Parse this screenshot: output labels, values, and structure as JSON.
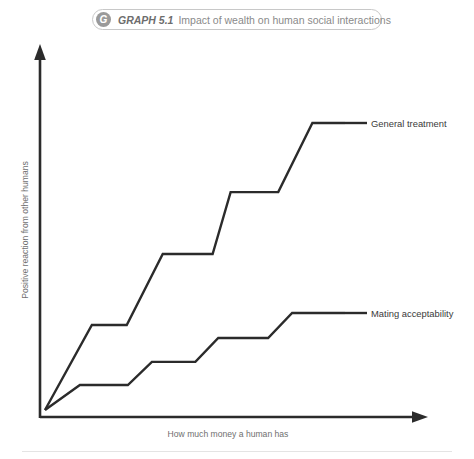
{
  "title": {
    "badge_letter": "G",
    "number_label": "GRAPH 5.1",
    "caption": "Impact of wealth on human social interactions"
  },
  "chart_data": {
    "type": "line",
    "title": "Impact of wealth on human social interactions",
    "xlabel": "How much money a human has",
    "ylabel": "Positive reaction from other humans",
    "grid": false,
    "legend_position": "right-inline",
    "axes_style": "arrow",
    "xlim": [
      0,
      10
    ],
    "ylim": [
      0,
      10
    ],
    "note": "Both series are rising staircase step functions starting from a common origin; axes are unlabeled/qualitative.",
    "series": [
      {
        "name": "General treatment",
        "label": "General treatment",
        "color": "#2b2b2b",
        "points": [
          {
            "x": 0.0,
            "y": 0.0
          },
          {
            "x": 1.25,
            "y": 2.35
          },
          {
            "x": 2.18,
            "y": 2.35
          },
          {
            "x": 3.14,
            "y": 4.31
          },
          {
            "x": 4.47,
            "y": 4.31
          },
          {
            "x": 4.95,
            "y": 6.02
          },
          {
            "x": 6.22,
            "y": 6.02
          },
          {
            "x": 7.13,
            "y": 7.93
          },
          {
            "x": 8.0,
            "y": 7.93
          }
        ]
      },
      {
        "name": "Mating acceptability",
        "label": "Mating acceptability",
        "color": "#2b2b2b",
        "points": [
          {
            "x": 0.0,
            "y": 0.0
          },
          {
            "x": 0.93,
            "y": 0.69
          },
          {
            "x": 2.21,
            "y": 0.69
          },
          {
            "x": 2.85,
            "y": 1.33
          },
          {
            "x": 4.01,
            "y": 1.33
          },
          {
            "x": 4.62,
            "y": 1.99
          },
          {
            "x": 5.95,
            "y": 1.99
          },
          {
            "x": 6.59,
            "y": 2.68
          },
          {
            "x": 8.0,
            "y": 2.68
          }
        ]
      }
    ]
  }
}
